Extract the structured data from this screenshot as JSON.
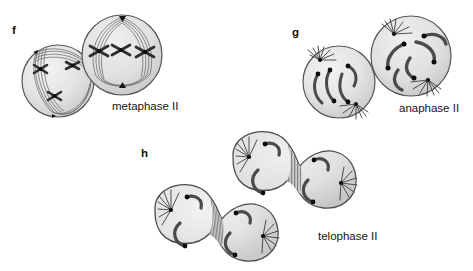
{
  "figure": {
    "background_color": "#ffffff",
    "ink_color": "#1a1a1a",
    "cell_fill_light": "#ededed",
    "cell_fill_mid": "#d8d8d8",
    "cell_outline": "#4a4a4a",
    "chromosome_color": "#3a3a3a",
    "centromere_color": "#101010",
    "furrow_color": "#8d8d8d"
  },
  "panels": [
    {
      "letter": "f",
      "label": "metaphase II",
      "cell_count": 2,
      "description": "Two rounded cells, each with X-shaped chromosomes aligned at the cell equator and spindle fibers arcing between opposite poles."
    },
    {
      "letter": "g",
      "label": "anaphase II",
      "cell_count": 2,
      "description": "Two rounded cells with V-shaped sister chromatids separating, dark centromeres leading toward opposite spindle poles."
    },
    {
      "letter": "h",
      "label": "telophase II",
      "cell_count": 2,
      "description": "Two dumbbell-shaped dividing cells, each pinched at a hatched cleavage furrow, with decondensing chromosomes and aster fibers at four poles."
    }
  ],
  "labels": {
    "f": "f",
    "g": "g",
    "h": "h",
    "metaphase": "metaphase II",
    "anaphase": "anaphase II",
    "telophase": "telophase II"
  }
}
